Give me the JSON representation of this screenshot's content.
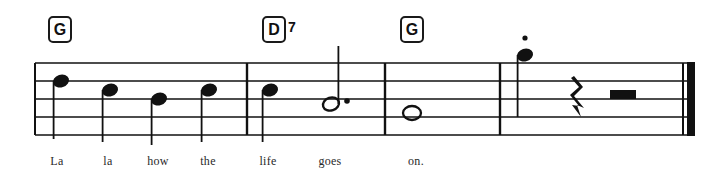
{
  "page": {
    "kind": "music-notation-excerpt",
    "width": 720,
    "height": 194,
    "background_color": "#ffffff",
    "ink_color": "#111111"
  },
  "staff": {
    "left": 35,
    "right": 695,
    "top_line_y": 63,
    "line_spacing": 18,
    "line_count": 5,
    "line_thickness": 1.6,
    "line_color": "#111111"
  },
  "chords": [
    {
      "name": "chord-g-1",
      "root": "G",
      "extension": "",
      "x": 48,
      "y": 16,
      "box_w": 24,
      "box_h": 27,
      "font_size": 16
    },
    {
      "name": "chord-d7",
      "root": "D",
      "extension": "7",
      "x": 262,
      "y": 16,
      "box_w": 24,
      "box_h": 27,
      "font_size": 16
    },
    {
      "name": "chord-g-2",
      "root": "G",
      "extension": "",
      "x": 400,
      "y": 16,
      "box_w": 24,
      "box_h": 27,
      "font_size": 16
    }
  ],
  "barlines": [
    {
      "name": "barline-1",
      "x": 247,
      "type": "single"
    },
    {
      "name": "barline-2",
      "x": 385,
      "type": "single"
    },
    {
      "name": "barline-3",
      "x": 500,
      "type": "single"
    }
  ],
  "final_barline": {
    "name": "final-double-barline",
    "thin_x": 682,
    "thick_x": 687,
    "thin_w": 2,
    "thick_w": 8
  },
  "notes": [
    {
      "name": "note-1",
      "lyric": "La",
      "x": 61,
      "y": 81,
      "head": "filled",
      "stem": "down",
      "stem_length": 58,
      "dotted": false,
      "staccato": false
    },
    {
      "name": "note-2",
      "lyric": "la",
      "x": 110,
      "y": 90,
      "head": "filled",
      "stem": "down",
      "stem_length": 52,
      "dotted": false,
      "staccato": false
    },
    {
      "name": "note-3",
      "lyric": "how",
      "x": 159,
      "y": 99,
      "head": "filled",
      "stem": "down",
      "stem_length": 46,
      "dotted": false,
      "staccato": false
    },
    {
      "name": "note-4",
      "lyric": "the",
      "x": 209,
      "y": 90,
      "head": "filled",
      "stem": "down",
      "stem_length": 52,
      "dotted": false,
      "staccato": false
    },
    {
      "name": "note-5",
      "lyric": "life",
      "x": 270,
      "y": 90,
      "head": "filled",
      "stem": "down",
      "stem_length": 52,
      "dotted": false,
      "staccato": false
    },
    {
      "name": "note-6",
      "lyric": "goes",
      "x": 331,
      "y": 104,
      "head": "open",
      "stem": "up",
      "stem_length": 58,
      "dotted": true,
      "staccato": false
    },
    {
      "name": "note-7",
      "lyric": "on.",
      "x": 412,
      "y": 113,
      "head": "whole",
      "stem": "none",
      "stem_length": 0,
      "dotted": false,
      "staccato": false
    },
    {
      "name": "note-8",
      "lyric": "",
      "x": 525,
      "y": 55,
      "head": "filled",
      "stem": "down",
      "stem_length": 62,
      "dotted": false,
      "staccato": true
    }
  ],
  "rests": [
    {
      "name": "quarter-rest",
      "type": "quarter",
      "x": 578,
      "y": 99
    },
    {
      "name": "half-rest",
      "type": "half",
      "x": 623,
      "y": 90
    }
  ],
  "lyrics": [
    {
      "name": "lyric-la-1",
      "text": "La",
      "x": 57
    },
    {
      "name": "lyric-la-2",
      "text": "la",
      "x": 108
    },
    {
      "name": "lyric-how",
      "text": "how",
      "x": 158
    },
    {
      "name": "lyric-the",
      "text": "the",
      "x": 208
    },
    {
      "name": "lyric-life",
      "text": "life",
      "x": 268
    },
    {
      "name": "lyric-goes",
      "text": "goes",
      "x": 330
    },
    {
      "name": "lyric-on",
      "text": "on.",
      "x": 416
    }
  ],
  "lyric_baseline_y": 166
}
